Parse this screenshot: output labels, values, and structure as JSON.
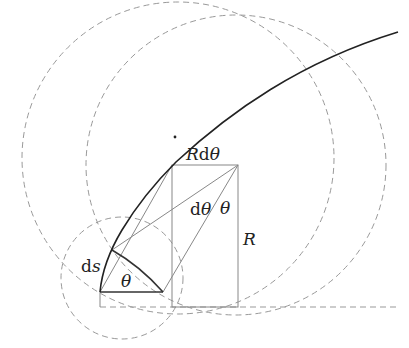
{
  "diagram": {
    "type": "geometry-curvature",
    "labels": {
      "r_dtheta_R": "R",
      "r_dtheta_d": "d",
      "r_dtheta_theta": "θ",
      "dtheta_d": "d",
      "dtheta_theta": "θ",
      "theta_right": "θ",
      "R": "R",
      "ds_d": "d",
      "ds_s": "s",
      "theta_bottom": "θ"
    },
    "colors": {
      "curve": "#222222",
      "construction": "#888888",
      "dashed": "#999999",
      "background": "#ffffff"
    }
  }
}
